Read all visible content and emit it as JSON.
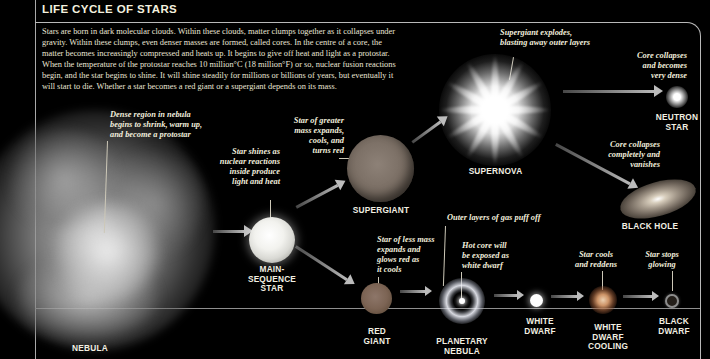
{
  "title": "LIFE CYCLE OF STARS",
  "intro": "Stars are born in dark molecular clouds. Within these clouds, matter clumps together as it collapses under\ngravity. Within these clumps, even denser masses are formed, called cores. In the centre of a core, the\nmatter becomes increasingly compressed and heats up. It begins to give off heat and light as a protostar.\nWhen the temperature of the protostar reaches 10 million°C (18 million°F) or so, nuclear fusion reactions\nbegin, and the star begins to shine. It will shine steadily for millions or billions of years, but eventually it\nwill start to die. Whether a star becomes a red giant or a supergiant depends on its mass.",
  "stages": {
    "nebula": {
      "label": "NEBULA"
    },
    "main_sequence": {
      "label": "MAIN-\nSEQUENCE\nSTAR"
    },
    "supergiant": {
      "label": "SUPERGIANT"
    },
    "supernova": {
      "label": "SUPERNOVA"
    },
    "neutron_star": {
      "label": "NEUTRON\nSTAR"
    },
    "black_hole": {
      "label": "BLACK HOLE"
    },
    "red_giant": {
      "label": "RED\nGIANT"
    },
    "planetary_nebula": {
      "label": "PLANETARY\nNEBULA"
    },
    "white_dwarf": {
      "label": "WHITE\nDWARF"
    },
    "white_dwarf_cooling": {
      "label": "WHITE\nDWARF\nCOOLING"
    },
    "black_dwarf": {
      "label": "BLACK\nDWARF"
    }
  },
  "captions": {
    "dense_region": "Dense region in nebula\nbegins to shrink, warm up,\nand become a protostar",
    "star_shines": "Star shines as\nnuclear reactions\ninside produce\nlight and heat",
    "greater_mass": "Star of greater\nmass expands,\ncools, and\nturns red",
    "supergiant_explodes": "Supergiant explodes,\nblasting away outer layers",
    "core_dense": "Core collapses\nand becomes\nvery dense",
    "core_vanishes": "Core collapses\ncompletely and\nvanishes",
    "outer_layers": "Outer layers of gas puff off",
    "hot_core": "Hot core will\nbe exposed as\nwhite dwarf",
    "less_mass": "Star of less mass\nexpands and\nglows red as\nit cools",
    "star_cools": "Star cools\nand reddens",
    "star_stops": "Star stops\nglowing"
  },
  "colors": {
    "background": "#000000",
    "frame_line": "#b9b9b9",
    "text": "#efecdc",
    "arrow": "#b8b8b8",
    "supergiant": "#7d7167",
    "red_giant": "#7c6454",
    "cooling_glow": "#cd9468"
  }
}
